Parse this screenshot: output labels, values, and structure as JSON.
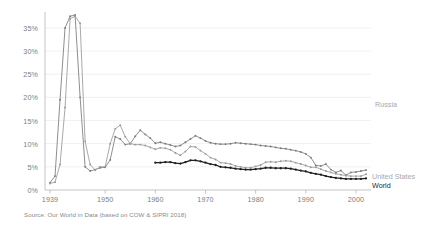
{
  "source_note": "Source: Our World in Data (based on COW & SIPRI 2018)",
  "legend": {
    "russia": "Russia",
    "united_states": "United States",
    "world": "World"
  },
  "colors": {
    "russia": "#7a7a7a",
    "united_states": "#9a9a9a",
    "world": "#1f1f1f",
    "grid": "#ececec",
    "axis": "#b5b5b5",
    "tick_text": "#7d7d7d"
  },
  "chart_data": {
    "type": "line",
    "title": "",
    "subtitle": "",
    "xlabel": "",
    "ylabel": "",
    "xlim": [
      1938,
      2003
    ],
    "ylim": [
      0,
      38
    ],
    "grid": true,
    "grid_axis": "y",
    "legend_position": "right-inline",
    "ytick_labels": [
      "0%",
      "5%",
      "10%",
      "15%",
      "20%",
      "25%",
      "30%",
      "35%"
    ],
    "ytick_values": [
      0,
      5,
      10,
      15,
      20,
      25,
      30,
      35
    ],
    "xtick_labels": [
      "1939",
      "1950",
      "1960",
      "1970",
      "1980",
      "1990",
      "2000"
    ],
    "xtick_values": [
      1939,
      1950,
      1960,
      1970,
      1980,
      1990,
      2000
    ],
    "series": [
      {
        "name": "Russia",
        "color": "#7a7a7a",
        "x": [
          1939,
          1940,
          1941,
          1942,
          1943,
          1944,
          1945,
          1946,
          1947,
          1948,
          1949,
          1950,
          1951,
          1952,
          1953,
          1954,
          1955,
          1956,
          1957,
          1958,
          1959,
          1960,
          1961,
          1962,
          1963,
          1964,
          1965,
          1966,
          1967,
          1968,
          1969,
          1970,
          1971,
          1972,
          1973,
          1974,
          1975,
          1976,
          1977,
          1978,
          1979,
          1980,
          1981,
          1982,
          1983,
          1984,
          1985,
          1986,
          1987,
          1988,
          1989,
          1990,
          1991,
          1992,
          1993,
          1994,
          1995,
          1996,
          1997,
          1998,
          1999,
          2000,
          2001,
          2002
        ],
        "y": [
          1.6,
          3.0,
          19.5,
          35.0,
          37.5,
          37.8,
          20.0,
          5.0,
          4.1,
          4.4,
          4.8,
          4.9,
          6.5,
          11.5,
          11.0,
          9.8,
          10.0,
          11.6,
          12.9,
          12.0,
          11.2,
          10.1,
          10.3,
          10.0,
          9.7,
          9.4,
          9.6,
          10.3,
          11.0,
          11.7,
          11.2,
          10.6,
          10.2,
          10.0,
          9.9,
          9.9,
          10.0,
          10.2,
          10.1,
          10.0,
          9.9,
          9.8,
          9.6,
          9.5,
          9.4,
          9.2,
          9.0,
          8.9,
          8.7,
          8.5,
          8.2,
          7.8,
          7.0,
          5.3,
          5.2,
          5.6,
          4.4,
          3.8,
          4.2,
          3.2,
          3.8,
          3.9,
          4.1,
          4.3
        ]
      },
      {
        "name": "United States",
        "color": "#9a9a9a",
        "x": [
          1939,
          1940,
          1941,
          1942,
          1943,
          1944,
          1945,
          1946,
          1947,
          1948,
          1949,
          1950,
          1951,
          1952,
          1953,
          1954,
          1955,
          1956,
          1957,
          1958,
          1959,
          1960,
          1961,
          1962,
          1963,
          1964,
          1965,
          1966,
          1967,
          1968,
          1969,
          1970,
          1971,
          1972,
          1973,
          1974,
          1975,
          1976,
          1977,
          1978,
          1979,
          1980,
          1981,
          1982,
          1983,
          1984,
          1985,
          1986,
          1987,
          1988,
          1989,
          1990,
          1991,
          1992,
          1993,
          1994,
          1995,
          1996,
          1997,
          1998,
          1999,
          2000,
          2001,
          2002
        ],
        "y": [
          1.4,
          1.7,
          5.5,
          17.8,
          37.0,
          37.5,
          36.0,
          10.5,
          5.5,
          4.3,
          5.0,
          5.0,
          10.0,
          13.2,
          14.0,
          11.5,
          10.0,
          9.8,
          9.8,
          9.6,
          9.2,
          8.8,
          9.1,
          9.0,
          8.7,
          8.0,
          7.5,
          8.3,
          9.4,
          9.3,
          8.5,
          7.8,
          7.0,
          6.6,
          5.9,
          5.8,
          5.6,
          5.2,
          5.0,
          4.8,
          4.8,
          5.1,
          5.4,
          6.0,
          6.1,
          6.0,
          6.2,
          6.3,
          6.2,
          5.9,
          5.6,
          5.3,
          4.9,
          4.9,
          4.5,
          4.1,
          3.8,
          3.5,
          3.3,
          3.1,
          3.0,
          3.0,
          3.0,
          3.4
        ]
      },
      {
        "name": "World",
        "color": "#1f1f1f",
        "x": [
          1960,
          1961,
          1962,
          1963,
          1964,
          1965,
          1966,
          1967,
          1968,
          1969,
          1970,
          1971,
          1972,
          1973,
          1974,
          1975,
          1976,
          1977,
          1978,
          1979,
          1980,
          1981,
          1982,
          1983,
          1984,
          1985,
          1986,
          1987,
          1988,
          1989,
          1990,
          1991,
          1992,
          1993,
          1994,
          1995,
          1996,
          1997,
          1998,
          1999,
          2000,
          2001,
          2002
        ],
        "y": [
          5.9,
          5.9,
          6.0,
          6.0,
          5.8,
          5.7,
          6.0,
          6.4,
          6.4,
          6.2,
          5.9,
          5.6,
          5.4,
          5.0,
          4.9,
          4.8,
          4.6,
          4.5,
          4.4,
          4.4,
          4.5,
          4.6,
          4.8,
          4.8,
          4.7,
          4.7,
          4.7,
          4.6,
          4.4,
          4.2,
          4.0,
          3.7,
          3.5,
          3.3,
          3.0,
          2.8,
          2.6,
          2.5,
          2.4,
          2.4,
          2.4,
          2.4,
          2.5
        ]
      }
    ]
  }
}
